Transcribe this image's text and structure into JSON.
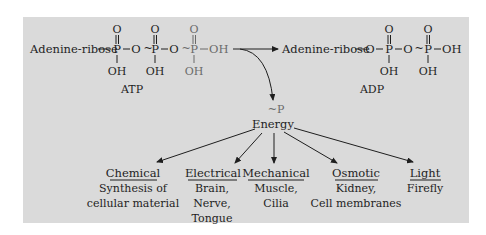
{
  "atp": {
    "prefix": "Adenine-ribose",
    "o1": "O",
    "o2": "O",
    "o3": "O",
    "p1": "P",
    "p2": "P",
    "p3": "P",
    "bridge_o1": "O",
    "bridge_o2": "O",
    "tilde1": "~",
    "tilde2": "~",
    "oh_end": "OH",
    "oh1": "OH",
    "oh2": "OH",
    "oh3": "OH",
    "label": "ATP"
  },
  "adp": {
    "prefix": "Adenine-ribose",
    "o_link": "O",
    "o1": "O",
    "o2": "O",
    "p1": "P",
    "p2": "P",
    "bridge_o": "O",
    "tilde": "~",
    "oh_end": "OH",
    "oh1": "OH",
    "oh2": "OH",
    "label": "ADP"
  },
  "released": {
    "phosphate": "~P",
    "energy": "Energy"
  },
  "energy_uses": [
    {
      "type": "Chemical",
      "lines": [
        "Synthesis of",
        "cellular material"
      ]
    },
    {
      "type": "Electrical",
      "lines": [
        "Brain,",
        "Nerve,",
        "Tongue"
      ]
    },
    {
      "type": "Mechanical",
      "lines": [
        "Muscle,",
        "Cilia"
      ]
    },
    {
      "type": "Osmotic",
      "lines": [
        "Kidney,",
        "Cell membranes"
      ]
    },
    {
      "type": "Light",
      "lines": [
        "Firefly"
      ]
    }
  ],
  "colors": {
    "panel": "#dadada",
    "ink": "#1e1e1e",
    "released_phosphate": "#6a6a6a"
  }
}
